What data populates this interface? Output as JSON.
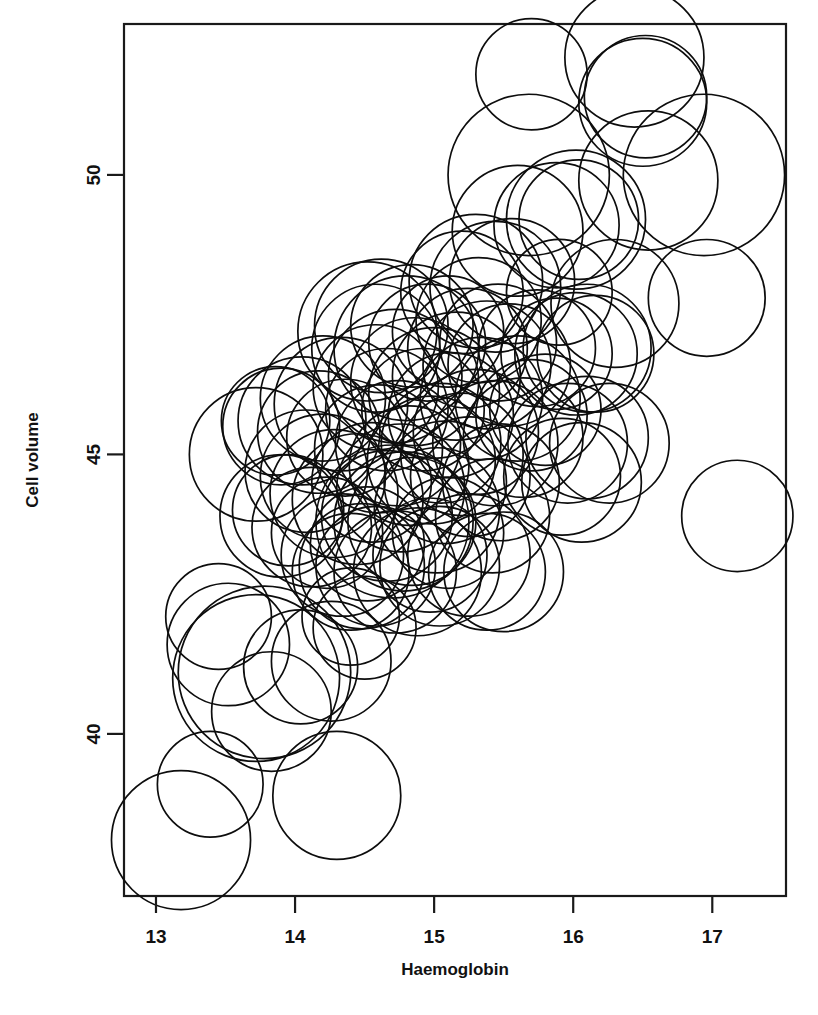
{
  "figure": {
    "background": "#ffffff",
    "foreground": "#0d0d0d",
    "width": 818,
    "height": 1015
  },
  "chart_data": {
    "type": "scatter",
    "subtype": "bubble",
    "title": "",
    "xlabel": "Haemoglobin",
    "ylabel": "Cell volume",
    "xlim": [
      12.77,
      17.53
    ],
    "ylim": [
      37.1,
      52.7
    ],
    "xticks": [
      13,
      14,
      15,
      16,
      17
    ],
    "xtick_labels": [
      "13",
      "14",
      "15",
      "16",
      "17"
    ],
    "yticks": [
      40,
      45,
      50
    ],
    "ytick_labels": [
      "40",
      "45",
      "50"
    ],
    "grid": false,
    "legend": false,
    "frame": true,
    "size_encoding": "circle radius (third variable, e.g. white cell count)",
    "series": [
      {
        "name": "blood sample",
        "marker": "open circle",
        "points": [
          {
            "x": 13.18,
            "y": 38.1,
            "r": 0.5
          },
          {
            "x": 13.39,
            "y": 39.1,
            "r": 0.38
          },
          {
            "x": 13.45,
            "y": 42.1,
            "r": 0.38
          },
          {
            "x": 13.52,
            "y": 41.6,
            "r": 0.44
          },
          {
            "x": 13.72,
            "y": 41.0,
            "r": 0.6
          },
          {
            "x": 13.78,
            "y": 41.1,
            "r": 0.62
          },
          {
            "x": 13.83,
            "y": 40.4,
            "r": 0.43
          },
          {
            "x": 14.04,
            "y": 41.2,
            "r": 0.41
          },
          {
            "x": 14.26,
            "y": 41.3,
            "r": 0.43
          },
          {
            "x": 14.3,
            "y": 38.9,
            "r": 0.46
          },
          {
            "x": 14.5,
            "y": 41.9,
            "r": 0.37
          },
          {
            "x": 13.9,
            "y": 43.9,
            "r": 0.44
          },
          {
            "x": 13.95,
            "y": 44.0,
            "r": 0.4
          },
          {
            "x": 13.86,
            "y": 45.6,
            "r": 0.39
          },
          {
            "x": 13.9,
            "y": 45.5,
            "r": 0.42
          },
          {
            "x": 13.72,
            "y": 45.0,
            "r": 0.48
          },
          {
            "x": 14.05,
            "y": 45.6,
            "r": 0.46
          },
          {
            "x": 14.17,
            "y": 45.4,
            "r": 0.44
          },
          {
            "x": 14.2,
            "y": 46.0,
            "r": 0.45
          },
          {
            "x": 14.33,
            "y": 45.9,
            "r": 0.48
          },
          {
            "x": 14.36,
            "y": 45.3,
            "r": 0.42
          },
          {
            "x": 14.08,
            "y": 44.7,
            "r": 0.44
          },
          {
            "x": 14.2,
            "y": 44.6,
            "r": 0.45
          },
          {
            "x": 14.28,
            "y": 44.3,
            "r": 0.46
          },
          {
            "x": 14.12,
            "y": 43.7,
            "r": 0.43
          },
          {
            "x": 14.23,
            "y": 43.6,
            "r": 0.4
          },
          {
            "x": 14.34,
            "y": 43.2,
            "r": 0.44
          },
          {
            "x": 14.4,
            "y": 42.9,
            "r": 0.42
          },
          {
            "x": 14.48,
            "y": 43.0,
            "r": 0.45
          },
          {
            "x": 14.52,
            "y": 43.4,
            "r": 0.41
          },
          {
            "x": 14.45,
            "y": 44.2,
            "r": 0.47
          },
          {
            "x": 14.55,
            "y": 44.5,
            "r": 0.43
          },
          {
            "x": 14.6,
            "y": 45.1,
            "r": 0.46
          },
          {
            "x": 14.66,
            "y": 45.8,
            "r": 0.44
          },
          {
            "x": 14.58,
            "y": 46.2,
            "r": 0.45
          },
          {
            "x": 14.72,
            "y": 46.4,
            "r": 0.48
          },
          {
            "x": 14.8,
            "y": 46.9,
            "r": 0.52
          },
          {
            "x": 14.86,
            "y": 46.3,
            "r": 0.46
          },
          {
            "x": 14.92,
            "y": 45.8,
            "r": 0.44
          },
          {
            "x": 14.74,
            "y": 45.2,
            "r": 0.45
          },
          {
            "x": 14.82,
            "y": 44.8,
            "r": 0.43
          },
          {
            "x": 14.76,
            "y": 44.4,
            "r": 0.46
          },
          {
            "x": 14.7,
            "y": 43.8,
            "r": 0.55
          },
          {
            "x": 14.78,
            "y": 43.8,
            "r": 0.5
          },
          {
            "x": 14.84,
            "y": 43.8,
            "r": 0.46
          },
          {
            "x": 14.66,
            "y": 43.9,
            "r": 0.47
          },
          {
            "x": 14.58,
            "y": 43.0,
            "r": 0.43
          },
          {
            "x": 14.72,
            "y": 42.9,
            "r": 0.44
          },
          {
            "x": 14.88,
            "y": 42.9,
            "r": 0.46
          },
          {
            "x": 14.97,
            "y": 43.2,
            "r": 0.41
          },
          {
            "x": 15.04,
            "y": 43.0,
            "r": 0.43
          },
          {
            "x": 15.1,
            "y": 43.6,
            "r": 0.4
          },
          {
            "x": 15.02,
            "y": 44.0,
            "r": 0.45
          },
          {
            "x": 15.08,
            "y": 44.5,
            "r": 0.44
          },
          {
            "x": 14.98,
            "y": 44.9,
            "r": 0.46
          },
          {
            "x": 15.05,
            "y": 45.2,
            "r": 0.43
          },
          {
            "x": 15.12,
            "y": 45.7,
            "r": 0.45
          },
          {
            "x": 15.0,
            "y": 46.1,
            "r": 0.47
          },
          {
            "x": 15.16,
            "y": 46.4,
            "r": 0.46
          },
          {
            "x": 15.2,
            "y": 45.0,
            "r": 0.44
          },
          {
            "x": 15.26,
            "y": 44.6,
            "r": 0.43
          },
          {
            "x": 15.3,
            "y": 45.4,
            "r": 0.45
          },
          {
            "x": 15.34,
            "y": 46.0,
            "r": 0.44
          },
          {
            "x": 15.38,
            "y": 46.6,
            "r": 0.46
          },
          {
            "x": 15.44,
            "y": 45.2,
            "r": 0.45
          },
          {
            "x": 15.48,
            "y": 44.5,
            "r": 0.42
          },
          {
            "x": 15.42,
            "y": 43.9,
            "r": 0.41
          },
          {
            "x": 15.25,
            "y": 43.2,
            "r": 0.44
          },
          {
            "x": 15.38,
            "y": 42.9,
            "r": 0.42
          },
          {
            "x": 15.5,
            "y": 42.9,
            "r": 0.43
          },
          {
            "x": 14.4,
            "y": 42.1,
            "r": 0.35
          },
          {
            "x": 14.58,
            "y": 46.9,
            "r": 0.46
          },
          {
            "x": 14.52,
            "y": 47.2,
            "r": 0.5
          },
          {
            "x": 14.62,
            "y": 47.3,
            "r": 0.48
          },
          {
            "x": 14.84,
            "y": 47.3,
            "r": 0.44
          },
          {
            "x": 14.95,
            "y": 47.0,
            "r": 0.42
          },
          {
            "x": 15.1,
            "y": 47.2,
            "r": 0.4
          },
          {
            "x": 15.24,
            "y": 46.9,
            "r": 0.43
          },
          {
            "x": 15.32,
            "y": 47.4,
            "r": 0.45
          },
          {
            "x": 15.46,
            "y": 47.0,
            "r": 0.42
          },
          {
            "x": 15.54,
            "y": 46.6,
            "r": 0.44
          },
          {
            "x": 15.6,
            "y": 46.0,
            "r": 0.45
          },
          {
            "x": 15.64,
            "y": 45.3,
            "r": 0.43
          },
          {
            "x": 15.7,
            "y": 45.7,
            "r": 0.4
          },
          {
            "x": 15.44,
            "y": 48.0,
            "r": 0.47
          },
          {
            "x": 15.56,
            "y": 48.1,
            "r": 0.45
          },
          {
            "x": 15.3,
            "y": 48.1,
            "r": 0.48
          },
          {
            "x": 15.2,
            "y": 47.9,
            "r": 0.44
          },
          {
            "x": 15.6,
            "y": 49.0,
            "r": 0.47
          },
          {
            "x": 15.74,
            "y": 46.9,
            "r": 0.42
          },
          {
            "x": 15.88,
            "y": 46.8,
            "r": 0.4
          },
          {
            "x": 16.02,
            "y": 46.8,
            "r": 0.44
          },
          {
            "x": 16.1,
            "y": 46.9,
            "r": 0.46
          },
          {
            "x": 16.16,
            "y": 46.8,
            "r": 0.42
          },
          {
            "x": 15.8,
            "y": 45.8,
            "r": 0.4
          },
          {
            "x": 15.96,
            "y": 45.2,
            "r": 0.43
          },
          {
            "x": 16.1,
            "y": 45.3,
            "r": 0.44
          },
          {
            "x": 16.26,
            "y": 45.2,
            "r": 0.43
          },
          {
            "x": 15.92,
            "y": 44.6,
            "r": 0.42
          },
          {
            "x": 16.06,
            "y": 44.5,
            "r": 0.43
          },
          {
            "x": 15.9,
            "y": 47.9,
            "r": 0.38
          },
          {
            "x": 15.88,
            "y": 49.1,
            "r": 0.45
          },
          {
            "x": 16.02,
            "y": 49.2,
            "r": 0.5
          },
          {
            "x": 16.04,
            "y": 49.2,
            "r": 0.43
          },
          {
            "x": 15.68,
            "y": 50.0,
            "r": 0.58
          },
          {
            "x": 15.7,
            "y": 51.8,
            "r": 0.4
          },
          {
            "x": 16.3,
            "y": 47.7,
            "r": 0.46
          },
          {
            "x": 16.54,
            "y": 49.9,
            "r": 0.5
          },
          {
            "x": 16.5,
            "y": 51.3,
            "r": 0.46
          },
          {
            "x": 16.52,
            "y": 51.4,
            "r": 0.44
          },
          {
            "x": 16.44,
            "y": 52.1,
            "r": 0.5
          },
          {
            "x": 16.94,
            "y": 50.0,
            "r": 0.58
          },
          {
            "x": 16.96,
            "y": 47.8,
            "r": 0.42
          },
          {
            "x": 17.18,
            "y": 43.9,
            "r": 0.4
          }
        ]
      }
    ]
  },
  "axes": {
    "x_axis_label": "Haemoglobin",
    "y_axis_label": "Cell volume"
  }
}
